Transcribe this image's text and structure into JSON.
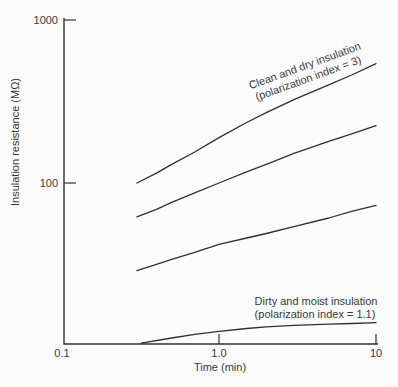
{
  "colors": {
    "background": "#fcfcfc",
    "line": "#2f2f2f",
    "text": "#383838"
  },
  "chart_data": {
    "type": "line",
    "title": "",
    "x_axis": {
      "label": "Time (min)",
      "scale": "log",
      "range": [
        0.1,
        10
      ],
      "ticks": [
        "0.1",
        "1.0",
        "10"
      ]
    },
    "y_axis": {
      "label": "Insulation resistance (MΩ)",
      "scale": "log",
      "range_shown": [
        100,
        1000
      ],
      "ticks": [
        "100",
        "1000"
      ]
    },
    "grid": false,
    "legend": "none (curves labeled by annotations)",
    "series": [
      {
        "id": "clean-dry-insulation",
        "label": "Clean and dry insulation (polarization index = 3)",
        "polarization_index": 3,
        "points": [
          [
            0.3,
            100
          ],
          [
            0.4,
            115
          ],
          [
            0.5,
            130
          ],
          [
            0.7,
            155
          ],
          [
            1,
            190
          ],
          [
            1.5,
            235
          ],
          [
            2,
            270
          ],
          [
            3,
            325
          ],
          [
            5,
            400
          ],
          [
            7,
            460
          ],
          [
            10,
            540
          ]
        ]
      },
      {
        "id": "intermediate-upper",
        "label": "",
        "points": [
          [
            0.3,
            62
          ],
          [
            0.4,
            69
          ],
          [
            0.5,
            76
          ],
          [
            0.7,
            87
          ],
          [
            1,
            100
          ],
          [
            1.5,
            117
          ],
          [
            2,
            130
          ],
          [
            3,
            152
          ],
          [
            5,
            180
          ],
          [
            7,
            200
          ],
          [
            10,
            225
          ]
        ]
      },
      {
        "id": "intermediate-lower",
        "label": "",
        "points": [
          [
            0.3,
            29
          ],
          [
            0.4,
            31.7
          ],
          [
            0.5,
            34
          ],
          [
            0.7,
            37.5
          ],
          [
            1,
            42
          ],
          [
            1.5,
            46
          ],
          [
            2,
            49
          ],
          [
            3,
            54
          ],
          [
            5,
            61
          ],
          [
            7,
            67
          ],
          [
            10,
            73
          ]
        ]
      },
      {
        "id": "dirty-moist-insulation",
        "label": "Dirty and moist insulation (polarization index = 1.1)",
        "polarization_index": 1.1,
        "points": [
          [
            0.32,
            10.4
          ],
          [
            0.5,
            11.2
          ],
          [
            0.7,
            11.8
          ],
          [
            1,
            12.3
          ],
          [
            1.5,
            12.8
          ],
          [
            2,
            13.1
          ],
          [
            3,
            13.4
          ],
          [
            5,
            13.6
          ],
          [
            7,
            13.75
          ],
          [
            10,
            13.9
          ]
        ]
      }
    ],
    "annotations": [
      {
        "id": "clean-dry-label",
        "lines": [
          "Clean and dry insulation",
          "(polarization index = 3)"
        ],
        "rotation_deg": -20,
        "attached_to": "clean-dry-insulation"
      },
      {
        "id": "dirty-moist-label",
        "lines": [
          "Dirty and moist insulation",
          "(polarization index = 1.1)"
        ],
        "rotation_deg": 0,
        "attached_to": "dirty-moist-insulation"
      }
    ]
  }
}
